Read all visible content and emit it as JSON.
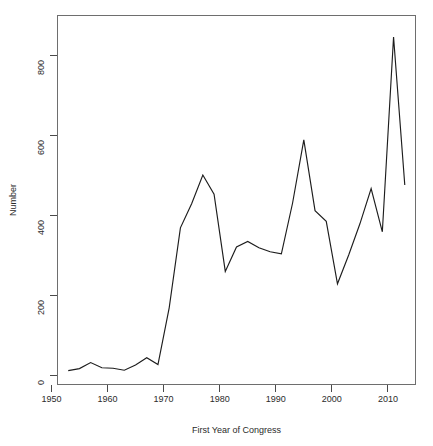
{
  "chart_data": {
    "type": "line",
    "title": "",
    "xlabel": "First Year of Congress",
    "ylabel": "Number",
    "xlim": [
      1951,
      2015
    ],
    "ylim": [
      -25,
      900
    ],
    "grid": false,
    "legend": "none",
    "x_ticks": [
      1950,
      1960,
      1970,
      1980,
      1990,
      2000,
      2010
    ],
    "x_tick_labels": [
      "1950",
      "1960",
      "1970",
      "1980",
      "1990",
      "2000",
      "2010"
    ],
    "y_ticks": [
      0,
      200,
      400,
      600,
      800
    ],
    "y_tick_labels": [
      "0",
      "200",
      "400",
      "600",
      "800"
    ],
    "series": [
      {
        "name": "Number",
        "color": "#1d1d1d",
        "x": [
          1953,
          1955,
          1957,
          1959,
          1961,
          1963,
          1965,
          1967,
          1969,
          1971,
          1973,
          1975,
          1977,
          1979,
          1981,
          1983,
          1985,
          1987,
          1989,
          1991,
          1993,
          1995,
          1997,
          1999,
          2001,
          2003,
          2005,
          2007,
          2009,
          2011,
          2013
        ],
        "values": [
          11,
          16,
          31,
          18,
          17,
          12,
          25,
          43,
          26,
          168,
          368,
          428,
          500,
          452,
          259,
          320,
          334,
          318,
          308,
          303,
          430,
          588,
          411,
          384,
          228,
          300,
          378,
          466,
          358,
          845,
          475
        ]
      }
    ]
  },
  "axes": {
    "y_axis_title": "Number",
    "x_axis_title": "First Year of Congress"
  }
}
